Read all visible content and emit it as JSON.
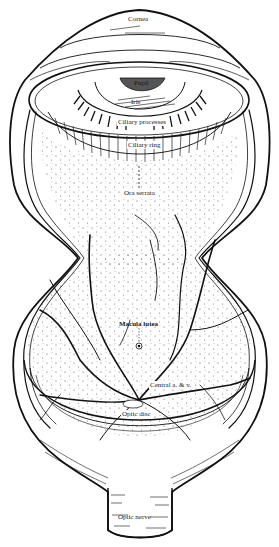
{
  "figure": {
    "labels": {
      "cornea": "Cornea",
      "pupil": "Pupil",
      "iris": "Iris",
      "ciliary_processes": "Ciliary processes",
      "ciliary_ring": "Ciliary ring",
      "ora_serrata": "Ora serrata",
      "macula_lutea": "Macula lutea",
      "central_vessels": "Central a. & v.",
      "optic_disc": "Optic disc",
      "optic_nerve": "Optic nerve"
    },
    "colors": {
      "ink": "#111111",
      "paper": "#ffffff",
      "stipple": "#555555"
    }
  }
}
